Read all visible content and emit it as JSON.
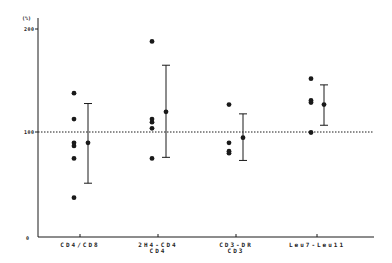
{
  "chart_data": {
    "type": "scatter",
    "title": "",
    "ylabel": "(%)",
    "xlabel": "",
    "ylim": [
      0,
      200
    ],
    "yticks": [
      0,
      100,
      200
    ],
    "reference_line": {
      "y": 100,
      "style": "dotted"
    },
    "grid": false,
    "legend": null,
    "categories": [
      "CD4/CD8",
      "2H4-CD4 / CD4",
      "CD3-DR / CD3",
      "Leu7-Leu11"
    ],
    "category_labels": [
      {
        "line1": "CD4/CD8",
        "line2": ""
      },
      {
        "line1": "2H4-CD4",
        "line2": "CD4"
      },
      {
        "line1": "CD3-DR",
        "line2": "CD3"
      },
      {
        "line1": "Leu7-Leu11",
        "line2": ""
      }
    ],
    "series": [
      {
        "name": "individual",
        "values": [
          [
            138,
            113,
            90,
            87,
            75,
            37
          ],
          [
            188,
            113,
            110,
            104,
            75
          ],
          [
            127,
            90,
            82,
            80
          ],
          [
            152,
            131,
            129,
            100
          ]
        ]
      },
      {
        "name": "mean",
        "values": [
          90,
          120,
          95,
          127
        ]
      },
      {
        "name": "error_upper",
        "values": [
          128,
          165,
          118,
          146
        ]
      },
      {
        "name": "error_lower",
        "values": [
          51,
          76,
          73,
          107
        ]
      }
    ]
  },
  "axis": {
    "unit": "(%)",
    "y_tick_labels": [
      "200",
      "100",
      "0"
    ]
  },
  "colors": {
    "ink": "#1a1a1a",
    "background": "#ffffff"
  }
}
